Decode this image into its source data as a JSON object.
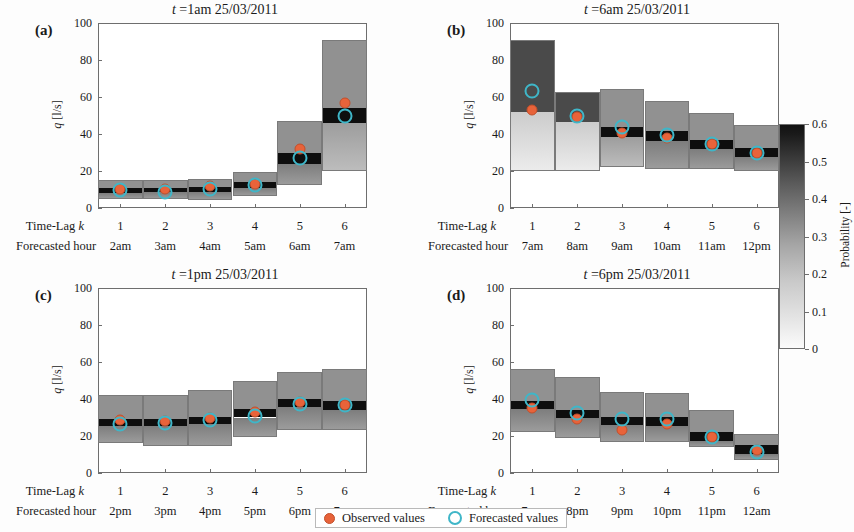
{
  "figure": {
    "width": 854,
    "height": 532,
    "ylabel": "q [l/s]",
    "ylabel_italic": "q",
    "ylabel_rest": " [l/s]",
    "yticks": [
      "0",
      "20",
      "40",
      "60",
      "80",
      "100"
    ],
    "ylim": [
      0,
      100
    ],
    "xrow1_header": "Time-Lag k",
    "xrow1_header_static": "Time-Lag ",
    "xrow1_header_italic": "k",
    "xrow2_header": "Forecasted hour",
    "timelags": [
      "1",
      "2",
      "3",
      "4",
      "5",
      "6"
    ]
  },
  "colorbar": {
    "label": "Probability [-]",
    "ticks": [
      "0.6",
      "0.5",
      "0.4",
      "0.3",
      "0.2",
      "0.1",
      "0"
    ],
    "values": [
      0.6,
      0.5,
      0.4,
      0.3,
      0.2,
      0.1,
      0.0
    ],
    "min": 0.0,
    "max": 0.6,
    "dark_color": "#141414",
    "light_color": "#fbfbfb"
  },
  "legend": {
    "observed_label": "Observed values",
    "forecasted_label": "Forecasted values",
    "observed_color": "#e8633a",
    "forecasted_color": "#3fb6c8"
  },
  "chart_data": {
    "type": "heatmap",
    "ylabel": "q [l/s]",
    "xlabel": "Time-Lag k / Forecasted hour",
    "ylim": [
      0,
      100
    ],
    "yticks": [
      0,
      20,
      40,
      60,
      80,
      100
    ],
    "colorbar": {
      "label": "Probability [-]",
      "range": [
        0,
        0.6
      ]
    },
    "legend": [
      "Observed values",
      "Forecasted values"
    ],
    "panels": [
      {
        "tag": "(a)",
        "title": "t =1am 25/03/2011",
        "issue_time": "1am 25/03/2011",
        "timelags": [
          1,
          2,
          3,
          4,
          5,
          6
        ],
        "forecasted_hours": [
          "2am",
          "3am",
          "4am",
          "5am",
          "6am",
          "7am"
        ],
        "observed": [
          10.5,
          10.5,
          12.0,
          13.0,
          32.0,
          57.0
        ],
        "forecasted": [
          9.5,
          8.5,
          10.5,
          12.5,
          27.0,
          50.0
        ],
        "bands": [
          {
            "lo": 5.0,
            "hi": 15.0,
            "mode_lo": 8.0,
            "mode_hi": 11.0
          },
          {
            "lo": 5.0,
            "hi": 15.0,
            "mode_lo": 8.5,
            "mode_hi": 11.0
          },
          {
            "lo": 4.5,
            "hi": 15.5,
            "mode_lo": 8.5,
            "mode_hi": 11.5
          },
          {
            "lo": 6.5,
            "hi": 19.5,
            "mode_lo": 11.0,
            "mode_hi": 14.0
          },
          {
            "lo": 12.5,
            "hi": 47.0,
            "mode_lo": 24.0,
            "mode_hi": 29.5
          },
          {
            "lo": 20.0,
            "hi": 91.0,
            "mode_lo": 46.0,
            "mode_hi": 54.0
          }
        ]
      },
      {
        "tag": "(b)",
        "title": "t =6am 25/03/2011",
        "issue_time": "6am 25/03/2011",
        "timelags": [
          1,
          2,
          3,
          4,
          5,
          6
        ],
        "forecasted_hours": [
          "7am",
          "8am",
          "9am",
          "10am",
          "11am",
          "12pm"
        ],
        "observed": [
          53.0,
          49.0,
          40.5,
          38.0,
          34.5,
          30.0
        ],
        "forecasted": [
          63.0,
          49.5,
          44.0,
          39.5,
          34.5,
          29.5
        ],
        "bands": [
          {
            "lo": 20.0,
            "hi": 91.0,
            "mode_lo": 52.0,
            "mode_hi": 91.0
          },
          {
            "lo": 20.0,
            "hi": 62.5,
            "mode_lo": 46.5,
            "mode_hi": 62.5
          },
          {
            "lo": 22.0,
            "hi": 64.5,
            "mode_lo": 38.5,
            "mode_hi": 44.0
          },
          {
            "lo": 21.0,
            "hi": 58.0,
            "mode_lo": 36.0,
            "mode_hi": 41.5
          },
          {
            "lo": 21.0,
            "hi": 51.5,
            "mode_lo": 32.0,
            "mode_hi": 37.0
          },
          {
            "lo": 20.0,
            "hi": 45.0,
            "mode_lo": 27.5,
            "mode_hi": 32.5
          }
        ]
      },
      {
        "tag": "(c)",
        "title": "t =1pm 25/03/2011",
        "issue_time": "1pm 25/03/2011",
        "timelags": [
          1,
          2,
          3,
          4,
          5,
          6
        ],
        "forecasted_hours": [
          "2pm",
          "3pm",
          "4pm",
          "5pm",
          "6pm",
          "7pm"
        ],
        "observed": [
          28.5,
          28.0,
          29.5,
          33.0,
          38.5,
          37.0
        ],
        "forecasted": [
          26.5,
          27.0,
          28.5,
          31.0,
          37.5,
          36.5
        ],
        "bands": [
          {
            "lo": 16.0,
            "hi": 42.0,
            "mode_lo": 25.5,
            "mode_hi": 29.0
          },
          {
            "lo": 14.5,
            "hi": 42.0,
            "mode_lo": 25.5,
            "mode_hi": 29.0
          },
          {
            "lo": 14.5,
            "hi": 45.0,
            "mode_lo": 26.5,
            "mode_hi": 30.5
          },
          {
            "lo": 19.5,
            "hi": 50.0,
            "mode_lo": 30.0,
            "mode_hi": 34.5
          },
          {
            "lo": 23.0,
            "hi": 54.5,
            "mode_lo": 35.5,
            "mode_hi": 40.0
          },
          {
            "lo": 23.0,
            "hi": 56.0,
            "mode_lo": 34.0,
            "mode_hi": 39.0
          }
        ]
      },
      {
        "tag": "(d)",
        "title": "t =6pm 25/03/2011",
        "issue_time": "6pm 25/03/2011",
        "timelags": [
          1,
          2,
          3,
          4,
          5,
          6
        ],
        "forecasted_hours": [
          "7pm",
          "8pm",
          "9pm",
          "10pm",
          "11pm",
          "12am"
        ],
        "observed": [
          35.0,
          29.0,
          23.5,
          26.5,
          19.5,
          12.5
        ],
        "forecasted": [
          39.5,
          32.5,
          29.0,
          29.0,
          19.5,
          11.5
        ],
        "bands": [
          {
            "lo": 22.0,
            "hi": 56.0,
            "mode_lo": 34.5,
            "mode_hi": 39.0
          },
          {
            "lo": 19.0,
            "hi": 52.0,
            "mode_lo": 29.5,
            "mode_hi": 34.0
          },
          {
            "lo": 17.0,
            "hi": 44.0,
            "mode_lo": 26.0,
            "mode_hi": 30.5
          },
          {
            "lo": 17.0,
            "hi": 43.0,
            "mode_lo": 25.5,
            "mode_hi": 30.5
          },
          {
            "lo": 14.0,
            "hi": 34.0,
            "mode_lo": 17.5,
            "mode_hi": 22.0
          },
          {
            "lo": 7.0,
            "hi": 21.0,
            "mode_lo": 10.0,
            "mode_hi": 15.0
          }
        ]
      }
    ]
  }
}
